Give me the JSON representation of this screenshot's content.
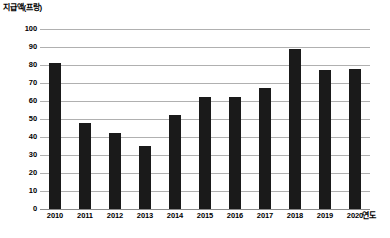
{
  "chart_data": {
    "type": "bar",
    "title": "",
    "ylabel": "지급액(프랑)",
    "xlabel": "연도",
    "categories": [
      "2010",
      "2011",
      "2012",
      "2013",
      "2014",
      "2015",
      "2016",
      "2017",
      "2018",
      "2019",
      "2020"
    ],
    "values": [
      81,
      48,
      42,
      35,
      52,
      62,
      62,
      67,
      89,
      77,
      78
    ],
    "ylim": [
      0,
      100
    ],
    "ytick_labels": [
      "100",
      "90",
      "80",
      "70",
      "60",
      "50",
      "40",
      "30",
      "20",
      "10",
      "0"
    ],
    "ytick_values": [
      100,
      90,
      80,
      70,
      60,
      50,
      40,
      30,
      20,
      10,
      0
    ],
    "ytick_step": 10,
    "grid": "horizontal",
    "legend": "none",
    "bar_color": "#1a1a1a",
    "gridline_color": "#b0b0b0",
    "background_color": "#ffffff"
  }
}
